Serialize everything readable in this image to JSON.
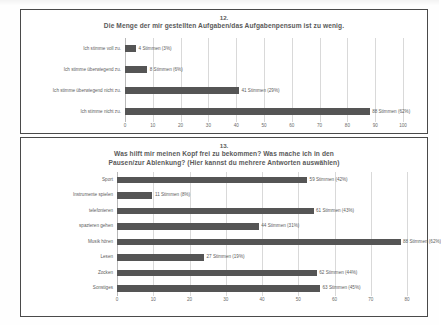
{
  "document": {
    "background_color": "#fefefe",
    "frame_color": "#4a4a4a",
    "bar_color": "#555555",
    "text_color": "#5d5d5d"
  },
  "charts": [
    {
      "number": "12.",
      "heading": "Die Menge der mir gestellten Aufgaben/das Aufgabenpensum ist zu wenig.",
      "chart_data": {
        "type": "bar",
        "orientation": "horizontal",
        "title": "Die Menge der mir gestellten Aufgaben/das Aufgabenpensum ist zu wenig.",
        "xlabel": "",
        "ylabel": "",
        "xlim": [
          0,
          100
        ],
        "xticks": [
          "0",
          "10",
          "20",
          "30",
          "40",
          "50",
          "60",
          "70",
          "80",
          "90",
          "100"
        ],
        "grid": true,
        "legend": "none",
        "categories": [
          "Ich stimme voll zu.",
          "Ich stimme überwiegend zu.",
          "Ich stimme überwiegend nicht zu.",
          "Ich stimme nicht zu."
        ],
        "values": [
          4,
          8,
          41,
          88
        ],
        "percents": [
          3,
          6,
          29,
          62
        ],
        "data_labels": [
          "4 Stimmen (3%)",
          "8 Stimmen (6%)",
          "41 Stimmen (29%)",
          "88 Stimmen (62%)"
        ]
      }
    },
    {
      "number": "13.",
      "heading_line1": "Was hilft mir meinen Kopf frei zu bekommen? Was mache ich in den",
      "heading_line2": "Pausen/zur Ablenkung? (Hier kannst du mehrere Antworten auswählen)",
      "chart_data": {
        "type": "bar",
        "orientation": "horizontal",
        "title": "Was hilft mir meinen Kopf frei zu bekommen? Was mache ich in den Pausen/zur Ablenkung? (Hier kannst du mehrere Antworten auswählen)",
        "xlabel": "",
        "ylabel": "",
        "xlim": [
          0,
          90
        ],
        "xticks": [
          "0",
          "10",
          "20",
          "30",
          "40",
          "50",
          "60",
          "70",
          "80"
        ],
        "grid": true,
        "legend": "none",
        "categories": [
          "Sport",
          "Instrumente spielen",
          "telefonieren",
          "spazieren gehen",
          "Musik hören",
          "Lesen",
          "Zocken",
          "Sonstiges"
        ],
        "values": [
          59,
          11,
          61,
          44,
          88,
          27,
          62,
          63
        ],
        "percents": [
          42,
          8,
          43,
          31,
          62,
          19,
          44,
          45
        ],
        "data_labels": [
          "59 Stimmen (42%)",
          "11 Stimmen (8%)",
          "61 Stimmen (43%)",
          "44 Stimmen (31%)",
          "88 Stimmen (62%)",
          "27 Stimmen (19%)",
          "62 Stimmen (44%)",
          "63 Stimmen (45%)"
        ]
      }
    }
  ]
}
